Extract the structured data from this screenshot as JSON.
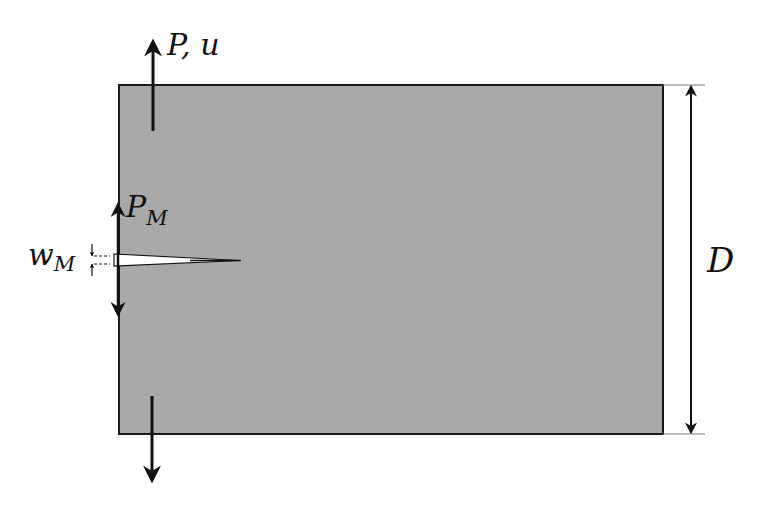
{
  "diagram": {
    "type": "notched specimen schematic",
    "specimen": {
      "fill": "#a9a9a9",
      "stroke": "#1a1a1a",
      "x": 119,
      "y": 85,
      "width": 544,
      "height": 349
    },
    "labels": {
      "load_top": "P, u",
      "mouth_load_main": "P",
      "mouth_load_sub": "M",
      "mouth_opening_main": "w",
      "mouth_opening_sub": "M",
      "depth": "D"
    },
    "colors": {
      "line": "#111111",
      "background": "#ffffff"
    }
  }
}
